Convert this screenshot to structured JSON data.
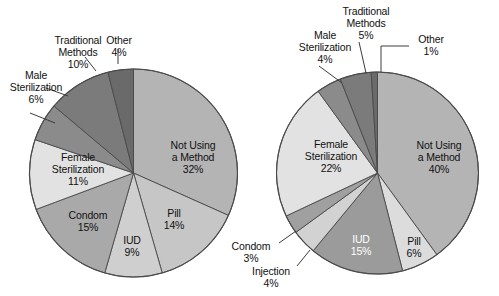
{
  "figure": {
    "background_color": "#ffffff",
    "type": "two-pie-figure",
    "outline_color": "#4a4a4a"
  },
  "chart_data": [
    {
      "type": "pie",
      "id": "left-pie",
      "title": "",
      "subtitle": "",
      "legend": "none",
      "labels_inside_and_outside": true,
      "total": 101,
      "categories": [
        "Not Using a Method",
        "Pill",
        "IUD",
        "Condom",
        "Female Sterilization",
        "Male Sterilization",
        "Traditional Methods",
        "Other"
      ],
      "values": [
        32,
        14,
        9,
        15,
        11,
        6,
        10,
        4
      ],
      "slices": [
        {
          "label": "Not Using a Method",
          "line1": "Not Using",
          "line2": "a Method",
          "pct_text": "32%",
          "value": 32,
          "color": "#b4b4b4",
          "placement": "inside",
          "text_color": "#111111"
        },
        {
          "label": "Pill",
          "line1": "Pill",
          "line2": "",
          "pct_text": "14%",
          "value": 14,
          "color": "#c6c6c6",
          "placement": "inside",
          "text_color": "#111111"
        },
        {
          "label": "IUD",
          "line1": "IUD",
          "line2": "",
          "pct_text": "9%",
          "value": 9,
          "color": "#cfcfcf",
          "placement": "inside",
          "text_color": "#111111"
        },
        {
          "label": "Condom",
          "line1": "Condom",
          "line2": "",
          "pct_text": "15%",
          "value": 15,
          "color": "#a9a9a9",
          "placement": "inside",
          "text_color": "#111111"
        },
        {
          "label": "Female Sterilization",
          "line1": "Female",
          "line2": "Sterilization",
          "pct_text": "11%",
          "value": 11,
          "color": "#e2e2e2",
          "placement": "inside",
          "text_color": "#111111"
        },
        {
          "label": "Male Sterilization",
          "line1": "Male",
          "line2": "Sterilization",
          "pct_text": "6%",
          "value": 6,
          "color": "#8b8b8b",
          "placement": "outside",
          "text_color": "#111111"
        },
        {
          "label": "Traditional Methods",
          "line1": "Traditional",
          "line2": "Methods",
          "pct_text": "10%",
          "value": 10,
          "color": "#7b7b7b",
          "placement": "outside",
          "text_color": "#111111"
        },
        {
          "label": "Other",
          "line1": "Other",
          "line2": "",
          "pct_text": "4%",
          "value": 4,
          "color": "#6a6a6a",
          "placement": "outside",
          "text_color": "#111111"
        }
      ]
    },
    {
      "type": "pie",
      "id": "right-pie",
      "title": "",
      "subtitle": "",
      "legend": "none",
      "labels_inside_and_outside": true,
      "total": 100,
      "categories": [
        "Not Using a Method",
        "Pill",
        "IUD",
        "Injection",
        "Condom",
        "Female Sterilization",
        "Male Sterilization",
        "Traditional Methods",
        "Other"
      ],
      "values": [
        40,
        6,
        15,
        4,
        3,
        22,
        4,
        5,
        1
      ],
      "slices": [
        {
          "label": "Not Using a Method",
          "line1": "Not Using",
          "line2": "a Method",
          "pct_text": "40%",
          "value": 40,
          "color": "#b4b4b4",
          "placement": "inside",
          "text_color": "#111111"
        },
        {
          "label": "Pill",
          "line1": "Pill",
          "line2": "",
          "pct_text": "6%",
          "value": 6,
          "color": "#dcdcdc",
          "placement": "inside",
          "text_color": "#111111"
        },
        {
          "label": "IUD",
          "line1": "IUD",
          "line2": "",
          "pct_text": "15%",
          "value": 15,
          "color": "#9b9b9b",
          "placement": "inside",
          "text_color": "#ffffff"
        },
        {
          "label": "Injection",
          "line1": "Injection",
          "line2": "",
          "pct_text": "4%",
          "value": 4,
          "color": "#d2d2d2",
          "placement": "outside",
          "text_color": "#111111"
        },
        {
          "label": "Condom",
          "line1": "Condom",
          "line2": "",
          "pct_text": "3%",
          "value": 3,
          "color": "#a0a0a0",
          "placement": "outside",
          "text_color": "#111111"
        },
        {
          "label": "Female Sterilization",
          "line1": "Female",
          "line2": "Sterilization",
          "pct_text": "22%",
          "value": 22,
          "color": "#e2e2e2",
          "placement": "inside",
          "text_color": "#111111"
        },
        {
          "label": "Male Sterilization",
          "line1": "Male",
          "line2": "Sterilization",
          "pct_text": "4%",
          "value": 4,
          "color": "#8b8b8b",
          "placement": "outside",
          "text_color": "#111111"
        },
        {
          "label": "Traditional Methods",
          "line1": "Traditional",
          "line2": "Methods",
          "pct_text": "5%",
          "value": 5,
          "color": "#7b7b7b",
          "placement": "outside",
          "text_color": "#111111"
        },
        {
          "label": "Other",
          "line1": "Other",
          "line2": "",
          "pct_text": "1%",
          "value": 1,
          "color": "#6a6a6a",
          "placement": "outside",
          "text_color": "#111111"
        }
      ]
    }
  ],
  "left_chart": {
    "labels": {
      "not_using_l1": "Not Using",
      "not_using_l2": "a Method",
      "not_using_pct": "32%",
      "pill": "Pill",
      "pill_pct": "14%",
      "iud": "IUD",
      "iud_pct": "9%",
      "condom": "Condom",
      "condom_pct": "15%",
      "female_l1": "Female",
      "female_l2": "Sterilization",
      "female_pct": "11%",
      "male_l1": "Male",
      "male_l2": "Sterilization",
      "male_pct": "6%",
      "trad_l1": "Traditional",
      "trad_l2": "Methods",
      "trad_pct": "10%",
      "other": "Other",
      "other_pct": "4%"
    }
  },
  "right_chart": {
    "labels": {
      "not_using_l1": "Not Using",
      "not_using_l2": "a Method",
      "not_using_pct": "40%",
      "pill": "Pill",
      "pill_pct": "6%",
      "iud": "IUD",
      "iud_pct": "15%",
      "injection": "Injection",
      "injection_pct": "4%",
      "condom": "Condom",
      "condom_pct": "3%",
      "female_l1": "Female",
      "female_l2": "Sterilization",
      "female_pct": "22%",
      "male_l1": "Male",
      "male_l2": "Sterilization",
      "male_pct": "4%",
      "trad_l1": "Traditional",
      "trad_l2": "Methods",
      "trad_pct": "5%",
      "other": "Other",
      "other_pct": "1%"
    }
  }
}
